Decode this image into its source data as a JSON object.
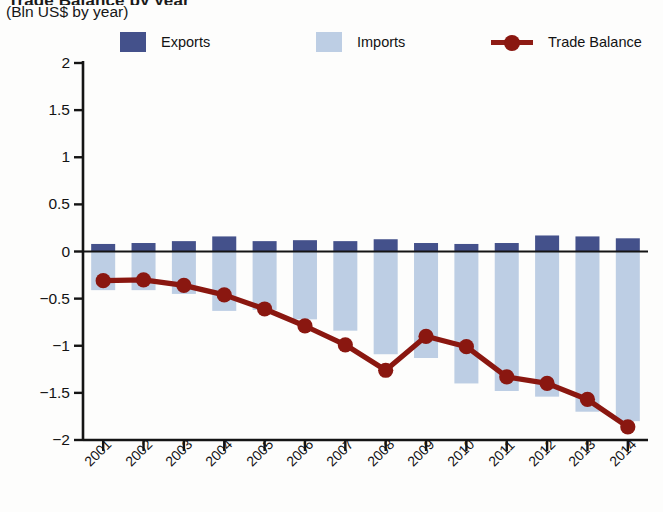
{
  "header": {
    "title_partial": "Trade Balance by year",
    "subtitle": "(Bln US$ by year)"
  },
  "legend": {
    "items": [
      {
        "label": "Exports",
        "color": "#44518b",
        "marker": "square"
      },
      {
        "label": "Imports",
        "color": "#bdcee4",
        "marker": "square"
      },
      {
        "label": "Trade Balance",
        "color": "#8a1710",
        "marker": "line-dot"
      }
    ]
  },
  "chart_data": {
    "type": "bar",
    "title": "",
    "subtitle": "(Bln US$ by year)",
    "xlabel": "",
    "ylabel": "",
    "ylim": [
      -2,
      2
    ],
    "ytick_step": 0.5,
    "grid": false,
    "legend_position": "top",
    "categories": [
      "2001",
      "2002",
      "2003",
      "2004",
      "2005",
      "2006",
      "2007",
      "2008",
      "2009",
      "2010",
      "2011",
      "2012",
      "2013",
      "2014"
    ],
    "ytick_labels": [
      "2",
      "1.5",
      "1",
      "0.5",
      "0",
      "−0.5",
      "−1",
      "−1.5",
      "−2"
    ],
    "ytick_values": [
      2,
      1.5,
      1,
      0.5,
      0,
      -0.5,
      -1,
      -1.5,
      -2
    ],
    "series": [
      {
        "name": "Exports",
        "type": "bar",
        "color": "#44518b",
        "values": [
          0.08,
          0.09,
          0.11,
          0.16,
          0.11,
          0.12,
          0.11,
          0.13,
          0.09,
          0.08,
          0.09,
          0.17,
          0.16,
          0.14
        ]
      },
      {
        "name": "Imports",
        "type": "bar",
        "color": "#bdcee4",
        "values": [
          -0.41,
          -0.41,
          -0.45,
          -0.63,
          -0.62,
          -0.72,
          -0.84,
          -1.09,
          -1.13,
          -1.4,
          -1.48,
          -1.54,
          -1.7,
          -1.8
        ]
      },
      {
        "name": "Trade Balance",
        "type": "line",
        "color": "#8a1710",
        "values": [
          -0.31,
          -0.3,
          -0.36,
          -0.46,
          -0.61,
          -0.79,
          -0.99,
          -1.26,
          -0.9,
          -1.01,
          -1.33,
          -1.4,
          -1.57,
          -1.86
        ]
      }
    ]
  },
  "colors": {
    "exports": "#44518b",
    "imports": "#bdcee4",
    "trade_balance": "#8a1710",
    "axis": "#141414",
    "text": "#131313",
    "background": "#fdfdfc"
  }
}
